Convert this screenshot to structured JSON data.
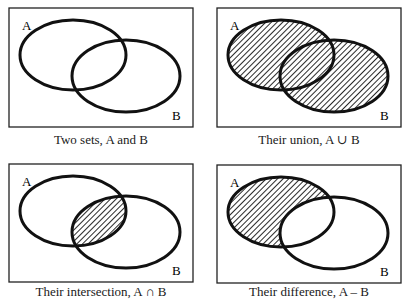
{
  "panels": [
    {
      "id": "two-sets",
      "caption": "Two sets, A and B",
      "shade": "none",
      "label_a": "A",
      "label_b": "B"
    },
    {
      "id": "union",
      "caption": "Their union, A ∪ B",
      "shade": "union",
      "label_a": "A",
      "label_b": "B"
    },
    {
      "id": "intersection",
      "caption": "Their intersection, A ∩ B",
      "shade": "intersection",
      "label_a": "A",
      "label_b": "B"
    },
    {
      "id": "difference",
      "caption": "Their difference, A – B",
      "shade": "difference",
      "label_a": "A",
      "label_b": "B"
    }
  ],
  "colors": {
    "stroke": "#111111",
    "hatch": "#111111",
    "background": "#ffffff"
  }
}
